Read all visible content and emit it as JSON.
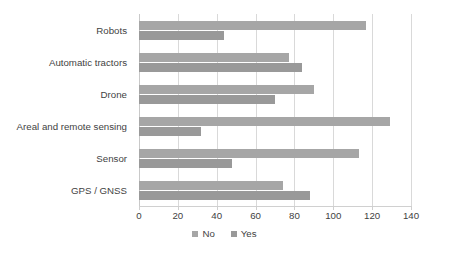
{
  "chart_data": {
    "type": "bar",
    "orientation": "horizontal",
    "title": "",
    "subtitle": "",
    "xlabel": "",
    "ylabel": "",
    "xlim": [
      0,
      140
    ],
    "xticks": [
      0,
      20,
      40,
      60,
      80,
      100,
      120,
      140
    ],
    "xtick_labels": [
      "0",
      "20",
      "40",
      "60",
      "80",
      "100",
      "120",
      "140"
    ],
    "grid": true,
    "legend_position": "bottom",
    "categories": [
      "Robots",
      "Automatic tractors",
      "Drone",
      "Areal and remote sensing",
      "Sensor",
      "GPS / GNSS"
    ],
    "series": [
      {
        "name": "No",
        "color": "#a6a6a6",
        "values": [
          117,
          77,
          90,
          129,
          113,
          74
        ]
      },
      {
        "name": "Yes",
        "color": "#999999",
        "values": [
          44,
          84,
          70,
          32,
          48,
          88
        ]
      }
    ]
  },
  "legend": {
    "items": [
      {
        "label": "No",
        "color": "#a6a6a6"
      },
      {
        "label": "Yes",
        "color": "#999999"
      }
    ]
  },
  "colors": {
    "series_no": "#a6a6a6",
    "series_yes": "#999999",
    "gridline": "#d9d9d9",
    "text": "#3f3f3f",
    "background": "#ffffff"
  }
}
